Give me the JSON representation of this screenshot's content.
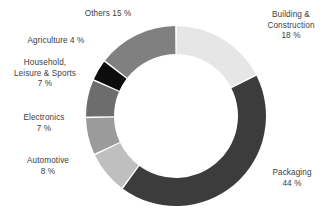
{
  "chart_data": {
    "type": "pie",
    "variant": "donut",
    "title": "",
    "subtitle": "",
    "xlabel": "",
    "ylabel": "",
    "legend_position": "outside-labels",
    "grid": false,
    "start_angle_deg": 0,
    "direction": "clockwise",
    "value_suffix": " %",
    "categories": [
      "Building & Construction",
      "Packaging",
      "Automotive",
      "Electronics",
      "Household, Leisure & Sports",
      "Agriculture",
      "Others"
    ],
    "values": [
      18,
      44,
      8,
      7,
      7,
      4,
      15
    ],
    "colors": [
      "#e6e6e6",
      "#3c3c3c",
      "#bfbfbf",
      "#9b9b9b",
      "#6d6d6d",
      "#0d0d0d",
      "#808080"
    ],
    "slices": [
      {
        "label": "Building & Construction",
        "value": 18,
        "value_text": "18 %",
        "color": "#e6e6e6"
      },
      {
        "label": "Packaging",
        "value": 44,
        "value_text": "44 %",
        "color": "#3c3c3c"
      },
      {
        "label": "Automotive",
        "value": 8,
        "value_text": "8 %",
        "color": "#bfbfbf"
      },
      {
        "label": "Electronics",
        "value": 7,
        "value_text": "7 %",
        "color": "#9b9b9b"
      },
      {
        "label": "Household, Leisure & Sports",
        "value": 7,
        "value_text": "7 %",
        "color": "#6d6d6d"
      },
      {
        "label": "Agriculture",
        "value": 4,
        "value_text": "4 %",
        "color": "#0d0d0d"
      },
      {
        "label": "Others",
        "value": 15,
        "value_text": "15 %",
        "color": "#808080"
      }
    ]
  },
  "labels": {
    "building": "Building &\nConstruction\n18 %",
    "packaging": "Packaging\n44 %",
    "automotive": "Automotive\n8 %",
    "electronics": "Electronics\n7 %",
    "household": "Household,\nLeisure & Sports\n7 %",
    "agriculture": "Agriculture 4 %",
    "others": "Others 15 %"
  },
  "style": {
    "background": "#ffffff",
    "text_color": "#3d3d3d",
    "separator_color": "#ffffff"
  }
}
